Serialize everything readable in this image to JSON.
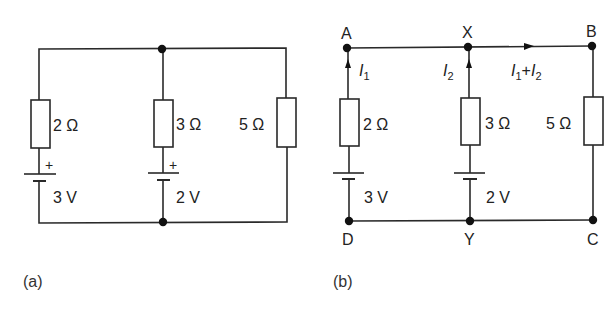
{
  "colors": {
    "line": "#2a2a2a",
    "node": "#111111",
    "text": "#222222",
    "background": "#ffffff"
  },
  "diagram_a": {
    "caption": "(a)",
    "branches": [
      {
        "resistor": "2 Ω",
        "battery": "3 V",
        "polarity": "+"
      },
      {
        "resistor": "3 Ω",
        "battery": "2 V",
        "polarity": "+"
      },
      {
        "resistor": "5 Ω"
      }
    ]
  },
  "diagram_b": {
    "caption": "(b)",
    "nodes": {
      "top": [
        "A",
        "X",
        "B"
      ],
      "bottom": [
        "D",
        "Y",
        "C"
      ]
    },
    "currents": {
      "branch1": {
        "symbol": "I",
        "sub": "1"
      },
      "branch2": {
        "symbol": "I",
        "sub": "2"
      },
      "sum": {
        "symbol1": "I",
        "sub1": "1",
        "plus": "+",
        "symbol2": "I",
        "sub2": "2"
      }
    },
    "branches": [
      {
        "resistor": "2 Ω",
        "battery": "3 V"
      },
      {
        "resistor": "3 Ω",
        "battery": "2 V"
      },
      {
        "resistor": "5 Ω"
      }
    ]
  }
}
